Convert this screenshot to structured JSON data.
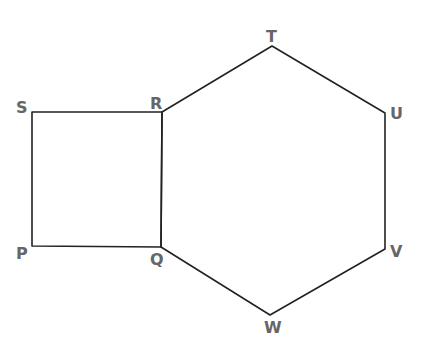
{
  "figure": {
    "colors": {
      "stroke": "#222222",
      "label": "#666666",
      "background": "#ffffff"
    },
    "vertices": {
      "P": {
        "label": "P",
        "x": 32,
        "y": 246,
        "label_x": 16,
        "label_y": 259
      },
      "Q": {
        "label": "Q",
        "x": 161,
        "y": 247,
        "label_x": 150,
        "label_y": 265
      },
      "R": {
        "label": "R",
        "x": 162,
        "y": 112,
        "label_x": 150,
        "label_y": 109
      },
      "S": {
        "label": "S",
        "x": 32,
        "y": 112,
        "label_x": 16,
        "label_y": 113
      },
      "T": {
        "label": "T",
        "x": 272,
        "y": 46,
        "label_x": 266,
        "label_y": 42
      },
      "U": {
        "label": "U",
        "x": 385,
        "y": 113,
        "label_x": 390,
        "label_y": 119
      },
      "V": {
        "label": "V",
        "x": 385,
        "y": 249,
        "label_x": 390,
        "label_y": 257
      },
      "W": {
        "label": "W",
        "x": 270,
        "y": 315,
        "label_x": 264,
        "label_y": 333
      }
    },
    "shapes": [
      {
        "name": "square",
        "label": "PQRS",
        "points": [
          "P",
          "Q",
          "R",
          "S"
        ]
      },
      {
        "name": "hexagon",
        "label": "QRTUVW",
        "points": [
          "Q",
          "R",
          "T",
          "U",
          "V",
          "W"
        ]
      }
    ]
  }
}
